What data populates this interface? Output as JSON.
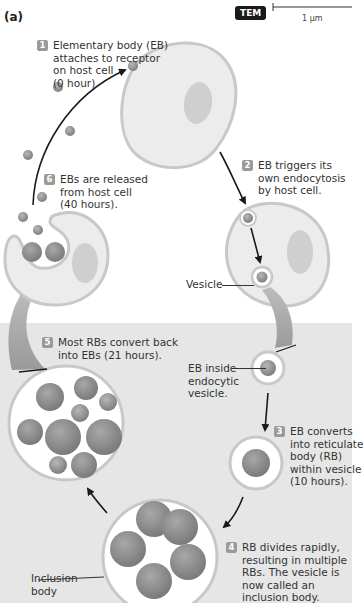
{
  "panel_label": "(a)",
  "microscopy_badge": "TEM",
  "scale_bar_label": "1 µm",
  "steps": [
    {
      "number": "1",
      "lines": [
        "Elementary body (EB)",
        "attaches to receptor",
        "on host cell",
        "(0 hour)."
      ]
    },
    {
      "number": "2",
      "lines": [
        "EB triggers its",
        "own endocytosis",
        "by host cell."
      ]
    },
    {
      "number": "3",
      "lines": [
        "EB converts",
        "into reticulate",
        "body (RB)",
        "within vesicle",
        "(10 hours)."
      ]
    },
    {
      "number": "4",
      "lines": [
        "RB divides rapidly,",
        "resulting in multiple",
        "RBs. The vesicle is",
        "now called an",
        "inclusion body."
      ]
    },
    {
      "number": "5",
      "lines": [
        "Most RBs convert back",
        "into EBs (21 hours)."
      ]
    },
    {
      "number": "6",
      "lines": [
        "EBs are released",
        "from host cell",
        "(40 hours)."
      ]
    }
  ],
  "labels": {
    "vesicle": "Vesicle",
    "eb_inside_vesicle": [
      "EB inside",
      "endocytic",
      "vesicle."
    ],
    "inclusion_body": [
      "Inclusion",
      "body"
    ]
  },
  "colors": {
    "background_top": "#ffffff",
    "background_bottom": "#e6e6e6",
    "cell_fill": "#ececec",
    "cell_outline": "#c8c8c8",
    "nucleus": "#cfcfcf",
    "eb_body": "#9a9a9a",
    "rb_body": "#8e8e8e",
    "badge": "#9a9a9a",
    "arrow": "#1a1a1a"
  }
}
